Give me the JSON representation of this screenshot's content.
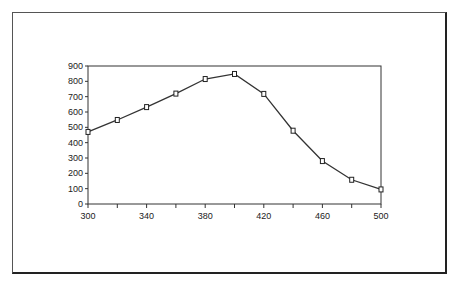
{
  "chart_data": {
    "type": "line",
    "title": "",
    "xlabel": "",
    "ylabel": "",
    "x": [
      300,
      320,
      340,
      360,
      380,
      400,
      420,
      440,
      460,
      480,
      500
    ],
    "series": [
      {
        "name": "series-1",
        "values": [
          470,
          548,
          632,
          720,
          815,
          848,
          718,
          478,
          280,
          158,
          95
        ]
      }
    ],
    "xlim": [
      300,
      500
    ],
    "ylim": [
      0,
      900
    ],
    "x_tick_labels": [
      "300",
      "340",
      "380",
      "420",
      "460",
      "500"
    ],
    "x_ticks_minor": [
      320,
      360,
      400,
      440,
      480
    ],
    "y_tick_labels": [
      "0",
      "100",
      "200",
      "300",
      "400",
      "500",
      "600",
      "700",
      "800",
      "900"
    ],
    "grid": false,
    "legend": "none",
    "marker": "square-open",
    "line_color": "#333333"
  }
}
